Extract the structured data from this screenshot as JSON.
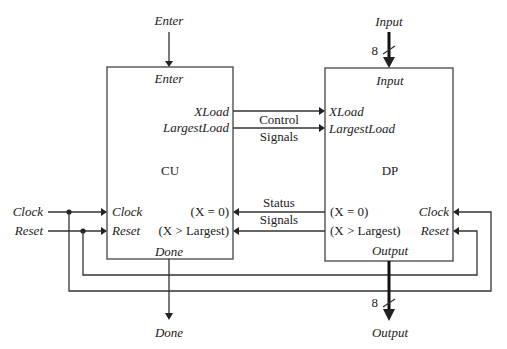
{
  "diagram": {
    "external_inputs": {
      "enter": "Enter",
      "input": "Input",
      "input_bus_width": "8",
      "clock": "Clock",
      "reset": "Reset"
    },
    "external_outputs": {
      "done": "Done",
      "output": "Output",
      "output_bus_width": "8"
    },
    "cu": {
      "name": "CU",
      "ports": {
        "enter": "Enter",
        "xload": "XLoad",
        "largestload": "LargestLoad",
        "clock": "Clock",
        "reset": "Reset",
        "x_eq_0": "(X = 0)",
        "x_gt_largest": "(X > Largest)",
        "done": "Done"
      }
    },
    "dp": {
      "name": "DP",
      "ports": {
        "input": "Input",
        "xload": "XLoad",
        "largestload": "LargestLoad",
        "clock": "Clock",
        "reset": "Reset",
        "x_eq_0": "(X = 0)",
        "x_gt_largest": "(X > Largest)",
        "output": "Output"
      }
    },
    "buses": {
      "control_line1": "Control",
      "control_line2": "Signals",
      "status_line1": "Status",
      "status_line2": "Signals"
    }
  }
}
